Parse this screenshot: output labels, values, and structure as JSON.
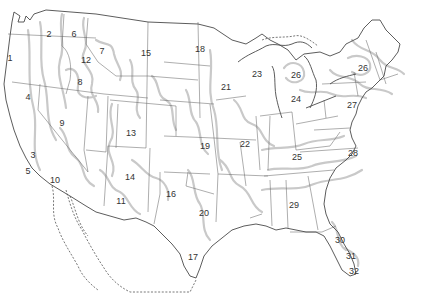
{
  "map": {
    "subject": "Contiguous United States with numbered climate/growing regions",
    "colors": {
      "state_border": "#6a6a6a",
      "coastline": "#4a4a4a",
      "region_boundary": "#c9c9c9",
      "label": "#333333",
      "background": "#ffffff"
    },
    "regions": [
      {
        "id": "1",
        "x": 10,
        "y": 58
      },
      {
        "id": "2",
        "x": 49,
        "y": 34
      },
      {
        "id": "3",
        "x": 33,
        "y": 155
      },
      {
        "id": "4",
        "x": 28,
        "y": 97
      },
      {
        "id": "5",
        "x": 28,
        "y": 171
      },
      {
        "id": "6",
        "x": 74,
        "y": 34
      },
      {
        "id": "7",
        "x": 102,
        "y": 51
      },
      {
        "id": "8",
        "x": 80,
        "y": 82
      },
      {
        "id": "9",
        "x": 62,
        "y": 123
      },
      {
        "id": "10",
        "x": 55,
        "y": 180
      },
      {
        "id": "11",
        "x": 121,
        "y": 201
      },
      {
        "id": "12",
        "x": 86,
        "y": 60
      },
      {
        "id": "13",
        "x": 131,
        "y": 133
      },
      {
        "id": "14",
        "x": 130,
        "y": 177
      },
      {
        "id": "15",
        "x": 146,
        "y": 53
      },
      {
        "id": "16",
        "x": 171,
        "y": 194
      },
      {
        "id": "17",
        "x": 193,
        "y": 257
      },
      {
        "id": "18",
        "x": 200,
        "y": 49
      },
      {
        "id": "19",
        "x": 205,
        "y": 146
      },
      {
        "id": "20",
        "x": 204,
        "y": 213
      },
      {
        "id": "21",
        "x": 226,
        "y": 87
      },
      {
        "id": "22",
        "x": 245,
        "y": 144
      },
      {
        "id": "23",
        "x": 257,
        "y": 74
      },
      {
        "id": "24",
        "x": 296,
        "y": 99
      },
      {
        "id": "25",
        "x": 297,
        "y": 157
      },
      {
        "id": "26a",
        "text": "26",
        "x": 296,
        "y": 75
      },
      {
        "id": "26b",
        "text": "26",
        "x": 363,
        "y": 68
      },
      {
        "id": "27",
        "x": 352,
        "y": 105
      },
      {
        "id": "28",
        "x": 353,
        "y": 153
      },
      {
        "id": "29",
        "x": 294,
        "y": 205
      },
      {
        "id": "30",
        "x": 340,
        "y": 240
      },
      {
        "id": "31",
        "x": 351,
        "y": 256
      },
      {
        "id": "32",
        "x": 354,
        "y": 271
      }
    ]
  }
}
